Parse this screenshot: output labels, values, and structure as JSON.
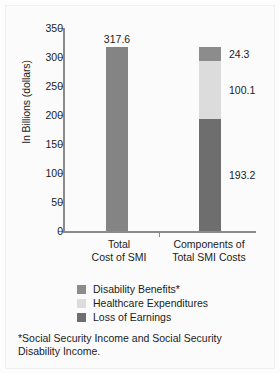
{
  "chart_data": {
    "type": "bar",
    "title": "",
    "xlabel": "",
    "ylabel": "In Billions (dollars)",
    "ylim": [
      0,
      350
    ],
    "ytick_values": [
      350,
      300,
      250,
      200,
      150,
      100,
      50,
      0
    ],
    "ytick_labels": [
      "350",
      "300",
      "250",
      "200",
      "150",
      "100",
      "50",
      "0"
    ],
    "grid": false,
    "legend_position": "below-plot",
    "categories": [
      "Total Cost of SMI",
      "Components of Total SMI Costs"
    ],
    "category_label_lines": [
      [
        "Total",
        "Cost of SMI"
      ],
      [
        "Components of",
        "Total SMI Costs"
      ]
    ],
    "bars": [
      {
        "category": "Total Cost of SMI",
        "stacked": false,
        "total": 317.6,
        "segments": [
          {
            "name": "Total Cost of SMI",
            "value": 317.6,
            "label": "317.6",
            "color": "#848484"
          }
        ]
      },
      {
        "category": "Components of Total SMI Costs",
        "stacked": true,
        "total": 317.6,
        "segments": [
          {
            "name": "Loss of Earnings",
            "value": 193.2,
            "label": "193.2",
            "color": "#6e6e6e"
          },
          {
            "name": "Healthcare Expenditures",
            "value": 100.1,
            "label": "100.1",
            "color": "#dcdcdc"
          },
          {
            "name": "Disability Benefits*",
            "value": 24.3,
            "label": "24.3",
            "color": "#8c8c8c"
          }
        ]
      }
    ],
    "series": [
      {
        "name": "Disability Benefits*",
        "values": [
          null,
          24.3
        ]
      },
      {
        "name": "Healthcare Expenditures",
        "values": [
          null,
          100.1
        ]
      },
      {
        "name": "Loss of Earnings",
        "values": [
          null,
          193.2
        ]
      },
      {
        "name": "Total Cost of SMI",
        "values": [
          317.6,
          null
        ]
      }
    ],
    "legend": [
      {
        "label": "Disability Benefits*",
        "color": "#8c8c8c"
      },
      {
        "label": "Healthcare Expenditures",
        "color": "#dcdcdc"
      },
      {
        "label": "Loss of Earnings",
        "color": "#6e6e6e"
      }
    ],
    "annotations": [
      "*Social Security Income and Social Security Disability Income."
    ]
  },
  "footnote": {
    "line1": "*Social Security Income and Social Security",
    "line2": "Disability Income."
  }
}
